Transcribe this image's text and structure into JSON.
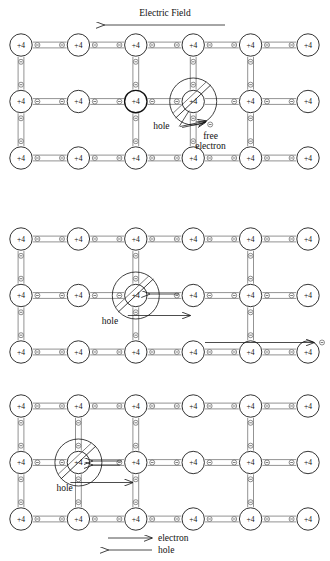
{
  "figure": {
    "title_arrow_label": "Electric Field",
    "atom_label": "+4",
    "electron_symbol": "minus-in-circle",
    "panel_count": 3,
    "lattice": {
      "columns": 6,
      "rows": 3
    }
  },
  "panels": [
    {
      "id": "panel-top",
      "name": "top-panel",
      "hole_column_index": 3,
      "annotations": [
        {
          "name": "hole-label",
          "text": "hole"
        },
        {
          "name": "free-electron-label-line1",
          "text": "free"
        },
        {
          "name": "free-electron-label-line2",
          "text": "electron"
        }
      ],
      "arrows": []
    },
    {
      "id": "panel-middle",
      "name": "middle-panel",
      "hole_column_index": 2,
      "annotations": [
        {
          "name": "hole-label",
          "text": "hole"
        }
      ],
      "arrows": [
        {
          "name": "electron-arrow-left",
          "direction": "left"
        },
        {
          "name": "hole-arrow-right",
          "direction": "right"
        },
        {
          "name": "free-electron-arrow-right",
          "direction": "right"
        }
      ]
    },
    {
      "id": "panel-bottom",
      "name": "bottom-panel",
      "hole_column_index": 1,
      "annotations": [
        {
          "name": "hole-label",
          "text": "hole"
        }
      ],
      "arrows": [
        {
          "name": "electron-arrow-left",
          "direction": "left"
        },
        {
          "name": "hole-arrow-right",
          "direction": "right"
        }
      ]
    }
  ],
  "legend": {
    "items": [
      {
        "name": "legend-electron",
        "arrow": "right",
        "label": "electron"
      },
      {
        "name": "legend-hole",
        "arrow": "left",
        "label": "hole"
      }
    ]
  },
  "colors": {
    "ink": "#111111",
    "bond": "#6f6f6f",
    "background": "#ffffff"
  }
}
